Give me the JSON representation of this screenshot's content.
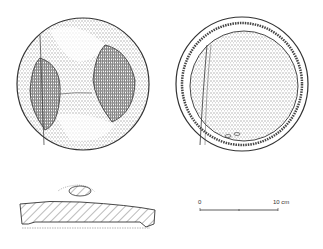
{
  "figure": {
    "views": [
      {
        "name": "top-view",
        "description": "Disc top surface with two hatched depressions"
      },
      {
        "name": "bottom-view",
        "description": "Disc underside with rim"
      },
      {
        "name": "section-view",
        "description": "Hatched cross-section profile with knob"
      }
    ],
    "scale_bar": {
      "start_label": "0",
      "end_label": "10 cm"
    },
    "colors": {
      "ink": "#333333",
      "hatch": "#555555",
      "background": "#ffffff"
    }
  }
}
